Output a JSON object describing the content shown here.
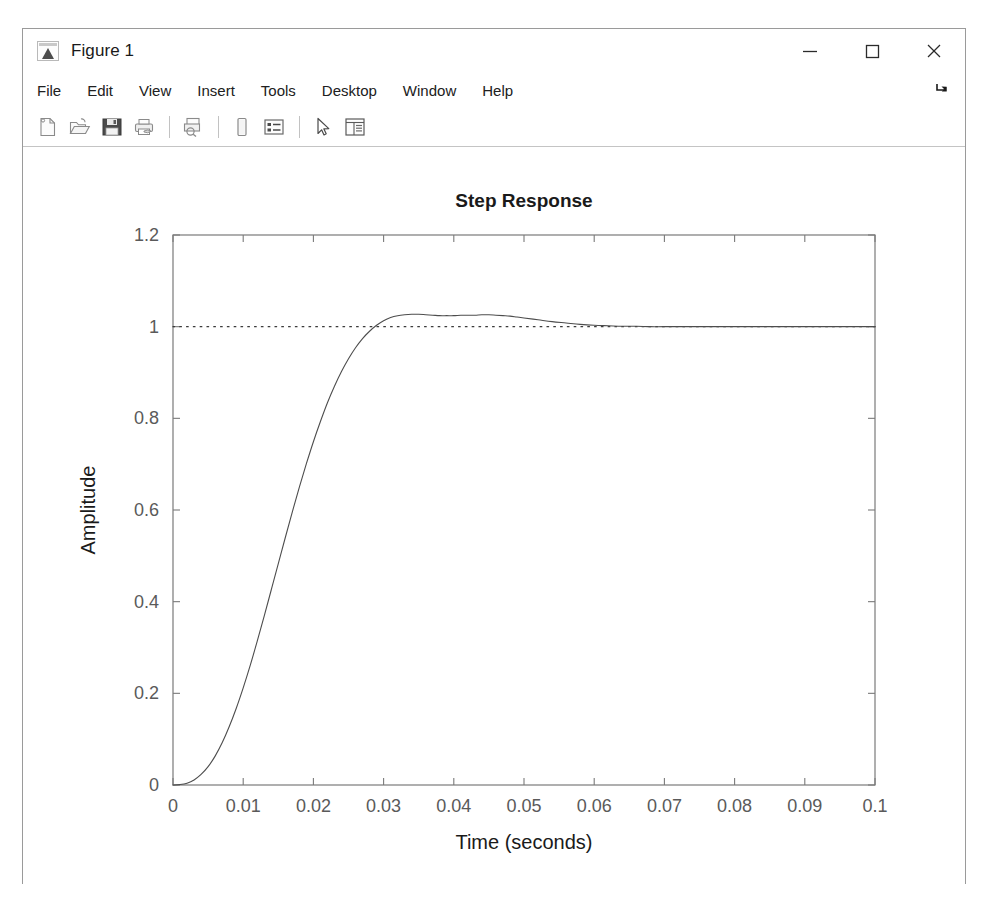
{
  "window": {
    "title": "Figure 1",
    "app_icon": "matlab-figure-icon",
    "controls": {
      "minimize": "minimize-icon",
      "maximize": "maximize-icon",
      "close": "close-icon"
    }
  },
  "menubar": {
    "items": [
      {
        "label": "File"
      },
      {
        "label": "Edit"
      },
      {
        "label": "View"
      },
      {
        "label": "Insert"
      },
      {
        "label": "Tools"
      },
      {
        "label": "Desktop"
      },
      {
        "label": "Window"
      },
      {
        "label": "Help"
      }
    ],
    "dock_control": "dock-arrow-icon"
  },
  "toolbar": {
    "buttons": [
      {
        "name": "new-figure-icon",
        "tooltip": "New Figure"
      },
      {
        "name": "open-file-icon",
        "tooltip": "Open File"
      },
      {
        "name": "save-figure-icon",
        "tooltip": "Save Figure"
      },
      {
        "name": "print-figure-icon",
        "tooltip": "Print Figure"
      },
      {
        "name": "separator",
        "tooltip": ""
      },
      {
        "name": "print-preview-icon",
        "tooltip": "Print Preview"
      },
      {
        "name": "separator",
        "tooltip": ""
      },
      {
        "name": "insert-colorbar-icon",
        "tooltip": "Insert Colorbar"
      },
      {
        "name": "insert-legend-icon",
        "tooltip": "Insert Legend"
      },
      {
        "name": "separator",
        "tooltip": ""
      },
      {
        "name": "pointer-select-icon",
        "tooltip": "Edit Plot"
      },
      {
        "name": "property-editor-icon",
        "tooltip": "Show Plot Tools and Dock Figure"
      }
    ]
  },
  "chart_data": {
    "type": "line",
    "title": "Step Response",
    "xlabel": "Time (seconds)",
    "ylabel": "Amplitude",
    "xlim": [
      0,
      0.1
    ],
    "ylim": [
      0,
      1.2
    ],
    "grid": false,
    "legend": null,
    "xticks": [
      0,
      0.01,
      0.02,
      0.03,
      0.04,
      0.05,
      0.06,
      0.07,
      0.08,
      0.09,
      0.1
    ],
    "xticklabels": [
      "0",
      "0.01",
      "0.02",
      "0.03",
      "0.04",
      "0.05",
      "0.06",
      "0.07",
      "0.08",
      "0.09",
      "0.1"
    ],
    "yticks": [
      0,
      0.2,
      0.4,
      0.6,
      0.8,
      1,
      1.2
    ],
    "yticklabels": [
      "0",
      "0.2",
      "0.4",
      "0.6",
      "0.8",
      "1",
      "1.2"
    ],
    "line_color": "#4d4d4d",
    "reference_line": {
      "name": "steady-state-reference",
      "value": 1.0,
      "style": "dotted",
      "color": "#3a3a3a"
    },
    "annotations": {
      "overshoot_percent": 2.5,
      "peak_time": 0.0445,
      "peak_value": 1.025,
      "settling_value": 1.0
    },
    "series": [
      {
        "name": "step-response",
        "x": [
          0,
          0.001,
          0.002,
          0.003,
          0.004,
          0.005,
          0.006,
          0.007,
          0.008,
          0.009,
          0.01,
          0.011,
          0.012,
          0.013,
          0.014,
          0.015,
          0.016,
          0.017,
          0.018,
          0.019,
          0.02,
          0.021,
          0.022,
          0.023,
          0.024,
          0.025,
          0.026,
          0.027,
          0.028,
          0.029,
          0.03,
          0.031,
          0.032,
          0.033,
          0.034,
          0.035,
          0.036,
          0.037,
          0.038,
          0.039,
          0.04,
          0.041,
          0.042,
          0.043,
          0.044,
          0.045,
          0.046,
          0.047,
          0.048,
          0.049,
          0.05,
          0.052,
          0.054,
          0.056,
          0.058,
          0.06,
          0.062,
          0.064,
          0.066,
          0.068,
          0.07,
          0.075,
          0.08,
          0.085,
          0.09,
          0.095,
          0.1
        ],
        "y": [
          0.0,
          0.001,
          0.004,
          0.011,
          0.023,
          0.04,
          0.063,
          0.092,
          0.127,
          0.167,
          0.212,
          0.261,
          0.314,
          0.369,
          0.426,
          0.483,
          0.54,
          0.596,
          0.65,
          0.701,
          0.749,
          0.793,
          0.834,
          0.87,
          0.902,
          0.93,
          0.954,
          0.974,
          0.99,
          1.003,
          1.013,
          1.02,
          1.024,
          1.026,
          1.027,
          1.027,
          1.026,
          1.025,
          1.024,
          1.024,
          1.024,
          1.025,
          1.025,
          1.025,
          1.026,
          1.026,
          1.025,
          1.024,
          1.023,
          1.021,
          1.019,
          1.015,
          1.011,
          1.008,
          1.005,
          1.003,
          1.002,
          1.001,
          1.001,
          1.0,
          1.0,
          1.0,
          1.0,
          1.0,
          1.0,
          1.0,
          1.0
        ]
      }
    ]
  }
}
